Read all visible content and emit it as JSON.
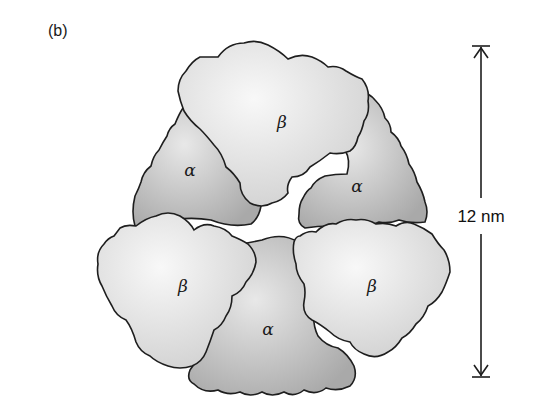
{
  "figure": {
    "panel_label": "(b)",
    "subunits": [
      {
        "id": "beta-top",
        "label": "β",
        "type": "beta"
      },
      {
        "id": "alpha-left",
        "label": "α",
        "type": "alpha"
      },
      {
        "id": "alpha-right",
        "label": "α",
        "type": "alpha"
      },
      {
        "id": "beta-left",
        "label": "β",
        "type": "beta"
      },
      {
        "id": "beta-right",
        "label": "β",
        "type": "beta"
      },
      {
        "id": "alpha-bottom",
        "label": "α",
        "type": "alpha"
      }
    ],
    "scale_bar": {
      "label": "12 nm"
    },
    "colors": {
      "alpha_fill": "#b9b9b9",
      "alpha_highlight": "#e6e6e6",
      "beta_fill": "#dcdcdc",
      "beta_highlight": "#f6f6f6",
      "outline": "#1e1e1e"
    }
  }
}
